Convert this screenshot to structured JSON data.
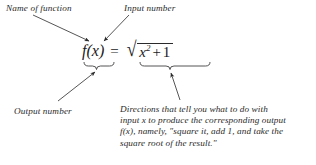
{
  "figure": {
    "type": "annotated-equation-diagram",
    "background_color": "#ffffff",
    "ink_color": "#2a2a2a"
  },
  "equation": {
    "function_name": "f(x)",
    "equals": "=",
    "radical_symbol": "√",
    "radicand_base": "x",
    "radicand_exponent": "2",
    "radicand_plus": "+",
    "radicand_constant": "1",
    "plain_text": "f(x) = √(x² + 1)"
  },
  "labels": {
    "name_of_function": "Name of function",
    "input_number": "Input number",
    "output_number": "Output number"
  },
  "directions": {
    "lines": [
      "Directions that tell you what to do with",
      "input x to produce the corresponding output",
      "f(x), namely, \"square it, add 1, and take the",
      "square root of the result.\""
    ]
  },
  "annotations": {
    "arrow_name_of_function": "arrow from 'Name of function' down-right to f",
    "arrow_input_number": "arrow from 'Input number' down-left to x",
    "arrow_output_number": "arrow from 'Output number' up-right to brace under f(x)",
    "arrow_directions": "arrow from 'Directions' up to brace under the radical",
    "brace_left": "underbrace beneath f(x)",
    "brace_right": "underbrace beneath the square root expression"
  }
}
